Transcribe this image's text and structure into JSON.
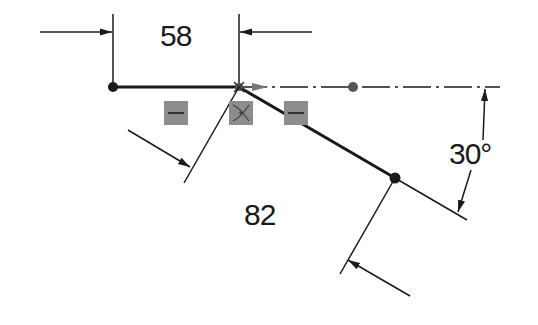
{
  "sketch": {
    "dimensions": {
      "horizontal_length": "58",
      "inclined_length": "82",
      "angle": "30°"
    },
    "relations": [
      {
        "type": "horizontal",
        "icon": "horizontal-relation-icon"
      },
      {
        "type": "coincident",
        "icon": "coincident-relation-icon"
      },
      {
        "type": "horizontal",
        "icon": "horizontal-relation-icon"
      }
    ],
    "colors": {
      "line": "#1a1a1a",
      "relation_badge": "#8c8c8c",
      "background": "#ffffff"
    }
  }
}
